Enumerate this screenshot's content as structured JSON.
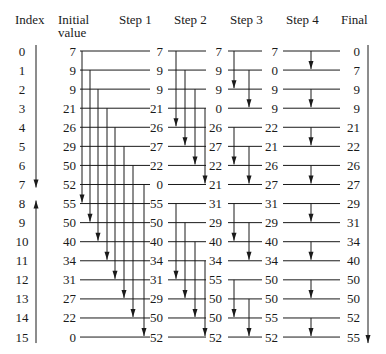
{
  "headers": {
    "index": "Index",
    "initial_line1": "Initial",
    "initial_line2": "value",
    "step1": "Step 1",
    "step2": "Step 2",
    "step3": "Step 3",
    "step4": "Step 4",
    "final": "Final"
  },
  "indices": [
    "0",
    "1",
    "2",
    "3",
    "4",
    "5",
    "6",
    "7",
    "8",
    "9",
    "10",
    "11",
    "12",
    "13",
    "14",
    "15"
  ],
  "columns": {
    "initial": [
      "7",
      "9",
      "9",
      "21",
      "26",
      "29",
      "50",
      "52",
      "55",
      "50",
      "40",
      "34",
      "31",
      "27",
      "22",
      "0"
    ],
    "step1": [
      "7",
      "9",
      "9",
      "21",
      "26",
      "27",
      "22",
      "0",
      "55",
      "50",
      "40",
      "34",
      "31",
      "29",
      "50",
      "52"
    ],
    "step2": [
      "7",
      "9",
      "9",
      "0",
      "26",
      "27",
      "22",
      "21",
      "31",
      "29",
      "40",
      "34",
      "55",
      "50",
      "50",
      "52"
    ],
    "step3": [
      "7",
      "0",
      "9",
      "9",
      "22",
      "21",
      "26",
      "27",
      "31",
      "29",
      "40",
      "34",
      "50",
      "50",
      "55",
      "52"
    ],
    "final": [
      "0",
      "7",
      "9",
      "9",
      "21",
      "22",
      "26",
      "27",
      "29",
      "31",
      "34",
      "40",
      "50",
      "50",
      "52",
      "55"
    ]
  },
  "stages": [
    {
      "name": "step1",
      "pairs": [
        [
          0,
          8
        ],
        [
          1,
          9
        ],
        [
          2,
          10
        ],
        [
          3,
          11
        ],
        [
          4,
          12
        ],
        [
          5,
          13
        ],
        [
          6,
          14
        ],
        [
          7,
          15
        ]
      ]
    },
    {
      "name": "step2",
      "pairs": [
        [
          0,
          4
        ],
        [
          1,
          5
        ],
        [
          2,
          6
        ],
        [
          3,
          7
        ],
        [
          8,
          12
        ],
        [
          9,
          13
        ],
        [
          10,
          14
        ],
        [
          11,
          15
        ]
      ]
    },
    {
      "name": "step3",
      "pairs": [
        [
          0,
          2
        ],
        [
          1,
          3
        ],
        [
          4,
          6
        ],
        [
          5,
          7
        ],
        [
          8,
          10
        ],
        [
          9,
          11
        ],
        [
          12,
          14
        ],
        [
          13,
          15
        ]
      ]
    },
    {
      "name": "step4",
      "pairs": [
        [
          0,
          1
        ],
        [
          2,
          3
        ],
        [
          4,
          5
        ],
        [
          6,
          7
        ],
        [
          8,
          9
        ],
        [
          10,
          11
        ],
        [
          12,
          13
        ],
        [
          14,
          15
        ]
      ]
    }
  ],
  "index_arrows": {
    "top_half": "down",
    "bottom_half": "up"
  },
  "final_arrow": "down"
}
